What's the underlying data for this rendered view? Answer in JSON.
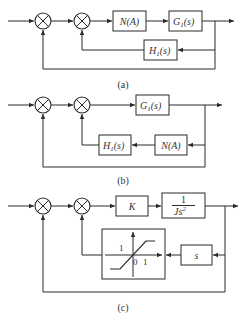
{
  "diagrams": [
    {
      "caption": "(a)",
      "blocks": {
        "n": "N(A)",
        "g": "G",
        "g_sub": "1",
        "g_arg": "(s)",
        "h": "H",
        "h_sub": "1",
        "h_arg": "(s)"
      }
    },
    {
      "caption": "(b)",
      "blocks": {
        "g": "G",
        "g_sub": "1",
        "g_arg": "(s)",
        "h": "H",
        "h_sub": "1",
        "h_arg": "(s)",
        "n": "N(A)"
      }
    },
    {
      "caption": "(c)",
      "blocks": {
        "k": "K",
        "plant_num": "1",
        "plant_den": "Js",
        "plant_den_exp": "2",
        "deriv": "s",
        "sat_label_y": "1",
        "sat_label_origin": "0",
        "sat_label_x": "1"
      }
    }
  ],
  "summing_junction_signs": {
    "input": "+",
    "feedback": "−"
  }
}
